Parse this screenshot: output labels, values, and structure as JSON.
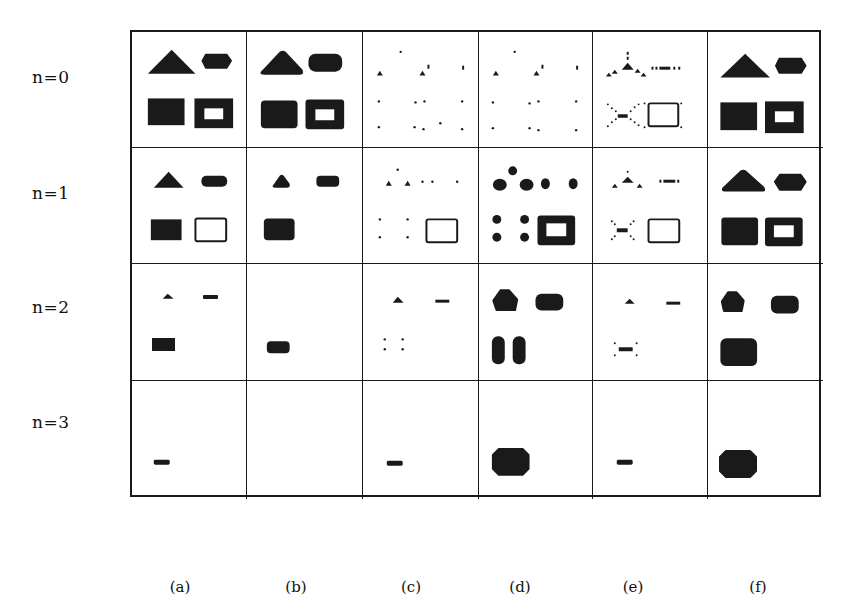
{
  "figure": {
    "row_labels": [
      "n=0",
      "n=1",
      "n=2",
      "n=3"
    ],
    "column_labels": [
      "(a)",
      "(b)",
      "(c)",
      "(d)",
      "(e)",
      "(f)"
    ],
    "ink_color": "#1a1a1a",
    "background_color": "#ffffff",
    "grid": {
      "rows": 4,
      "columns": 6,
      "col_edges_px": [
        130,
        245,
        361,
        477,
        591,
        706,
        821
      ],
      "row_edges_px": [
        30,
        146,
        262,
        379,
        497
      ]
    },
    "cells": [
      [
        {
          "col": "a",
          "row": 0,
          "description": "triangle, hexagon, filled square, hollow square"
        },
        {
          "col": "b",
          "row": 0,
          "description": "rounded triangle, rounded hexagon, rounded filled square, rounded hollow square"
        },
        {
          "col": "c",
          "row": 0,
          "description": "sparse dots and small triangles"
        },
        {
          "col": "d",
          "row": 0,
          "description": "sparse dots and small triangles"
        },
        {
          "col": "e",
          "row": 0,
          "description": "dotted skeleton triangle, dashed line, x-skeleton with bar, hollow rectangle"
        },
        {
          "col": "f",
          "row": 0,
          "description": "triangle, hexagon, filled square, hollow square"
        }
      ],
      [
        {
          "col": "a",
          "row": 1,
          "description": "small triangle, small hexagon, filled square, thin hollow rectangle"
        },
        {
          "col": "b",
          "row": 1,
          "description": "small rounded triangle, small rounded bar, rounded filled square"
        },
        {
          "col": "c",
          "row": 1,
          "description": "small triangles, dots, hollow rectangle"
        },
        {
          "col": "d",
          "row": 1,
          "description": "blobs, dots, thick hollow square"
        },
        {
          "col": "e",
          "row": 1,
          "description": "dotted triangle, dashed bar, x-skeleton, hollow rectangle"
        },
        {
          "col": "f",
          "row": 1,
          "description": "rounded triangle, hexagon, filled square, hollow square"
        }
      ],
      [
        {
          "col": "a",
          "row": 2,
          "description": "tiny triangle, short bar, small filled rectangle"
        },
        {
          "col": "b",
          "row": 2,
          "description": "small rounded filled rectangle"
        },
        {
          "col": "c",
          "row": 2,
          "description": "tiny triangle, short bar, four dots"
        },
        {
          "col": "d",
          "row": 2,
          "description": "rounded pentagon, rounded hexagon, two stacked blobs"
        },
        {
          "col": "e",
          "row": 2,
          "description": "tiny triangle, short bar, bar with corner dots"
        },
        {
          "col": "f",
          "row": 2,
          "description": "rounded pentagon, rounded hexagon, large rounded square"
        }
      ],
      [
        {
          "col": "a",
          "row": 3,
          "description": "short bar"
        },
        {
          "col": "b",
          "row": 3,
          "description": "empty"
        },
        {
          "col": "c",
          "row": 3,
          "description": "short bar"
        },
        {
          "col": "d",
          "row": 3,
          "description": "large octagon"
        },
        {
          "col": "e",
          "row": 3,
          "description": "short bar"
        },
        {
          "col": "f",
          "row": 3,
          "description": "large octagon"
        }
      ]
    ]
  }
}
